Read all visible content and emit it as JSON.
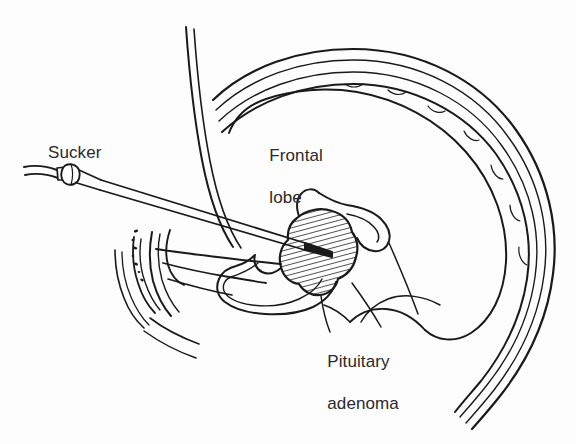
{
  "figure": {
    "type": "medical-line-illustration",
    "view": "mid-sagittal section of the head",
    "background_color": "#fdfdfd",
    "ink_color": "#1a1a1a",
    "text_color": "#2a2a2a",
    "width": 576,
    "height": 444
  },
  "labels": {
    "sucker": "Sucker",
    "frontal_lobe_line1": "Frontal",
    "frontal_lobe_line2": "lobe",
    "adenoma_line1": "Pituitary",
    "adenoma_line2": "adenoma"
  },
  "structures": [
    {
      "name": "skull-vault",
      "description": "outer cranial bone band with stippled diploe"
    },
    {
      "name": "frontal-lobe",
      "description": "large unlabelled brain outline beneath the vault"
    },
    {
      "name": "facial-profile",
      "description": "vertical double line forming forehead and nose bridge"
    },
    {
      "name": "nasal-turbinates",
      "description": "scroll-shaped bones with stippling, lower left"
    },
    {
      "name": "sphenoid-sinus",
      "description": "air cavity below the sella"
    },
    {
      "name": "pituitary-adenoma",
      "description": "hatched oval tumour mass in the sella turcica"
    },
    {
      "name": "sucker-instrument",
      "description": "suction tube with hub entering through the nose to the tumour"
    },
    {
      "name": "brainstem",
      "description": "contours to the right of the sella"
    }
  ],
  "annotations": {
    "leader_lines": 3,
    "hatching": {
      "target": "pituitary-adenoma",
      "angle_deg": 75,
      "spacing_px": 5
    }
  }
}
